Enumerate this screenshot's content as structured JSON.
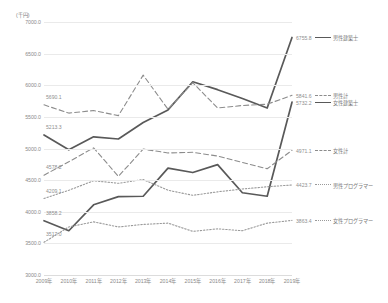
{
  "chart_data": {
    "type": "line",
    "title": "",
    "subtitle": "",
    "unit_label": "(千円)",
    "xlabel": "",
    "ylabel": "",
    "ylim": [
      3000.0,
      7000.0
    ],
    "ytick_step": 500,
    "grid": true,
    "legend_position": "right",
    "categories": [
      "2009年",
      "2010年",
      "2011年",
      "2012年",
      "2013年",
      "2014年",
      "2015年",
      "2016年",
      "2017年",
      "2018年",
      "2019年"
    ],
    "ytick_labels": [
      "3000.0",
      "3500.0",
      "4000.0",
      "4500.0",
      "5000.0",
      "5500.0",
      "6000.0",
      "6500.0",
      "7000.0"
    ],
    "ytick_values": [
      3000.0,
      3500.0,
      4000.0,
      4500.0,
      5000.0,
      5500.0,
      6000.0,
      6500.0,
      7000.0
    ],
    "series": [
      {
        "name": "男性建築士",
        "style": "solid",
        "color": "#595959",
        "start_label": "5213.3",
        "end_label": "6755.8",
        "values": [
          5213.3,
          4980.0,
          5185.0,
          5150.0,
          5410.0,
          5610.0,
          6055.0,
          5930.0,
          5790.0,
          5640.0,
          6755.8
        ]
      },
      {
        "name": "男性計",
        "style": "dashed",
        "color": "#8c8c8c",
        "start_label": "5690.1",
        "end_label": "5841.6",
        "values": [
          5690.1,
          5560.0,
          5600.0,
          5520.0,
          6160.0,
          5620.0,
          6040.0,
          5640.0,
          5680.0,
          5700.0,
          5841.6
        ]
      },
      {
        "name": "女性建築士",
        "style": "solid",
        "color": "#595959",
        "start_label": "3858.2",
        "end_label": "5732.2",
        "values": [
          3858.2,
          3700.0,
          4110.0,
          4240.0,
          4245.0,
          4690.0,
          4620.0,
          4745.0,
          4300.0,
          4245.0,
          5732.2
        ]
      },
      {
        "name": "女性計",
        "style": "dashed",
        "color": "#8c8c8c",
        "start_label": "4578.2",
        "end_label": "4971.1",
        "values": [
          4578.2,
          4790.0,
          5010.0,
          4560.0,
          4990.0,
          4930.0,
          4940.0,
          4880.0,
          4780.0,
          4680.0,
          4971.1
        ]
      },
      {
        "name": "男性プログラマー",
        "style": "dotted",
        "color": "#9a9a9a",
        "start_label": "4209.1",
        "end_label": "4423.7",
        "values": [
          4209.1,
          4340.0,
          4490.0,
          4450.0,
          4510.0,
          4340.0,
          4260.0,
          4315.0,
          4360.0,
          4395.0,
          4423.7
        ]
      },
      {
        "name": "女性プログラマー",
        "style": "dotted",
        "color": "#9a9a9a",
        "start_label": "3517.0",
        "end_label": "3863.4",
        "values": [
          3517.0,
          3760.0,
          3840.0,
          3760.0,
          3800.0,
          3820.0,
          3690.0,
          3730.0,
          3700.0,
          3820.0,
          3863.4
        ]
      }
    ]
  }
}
